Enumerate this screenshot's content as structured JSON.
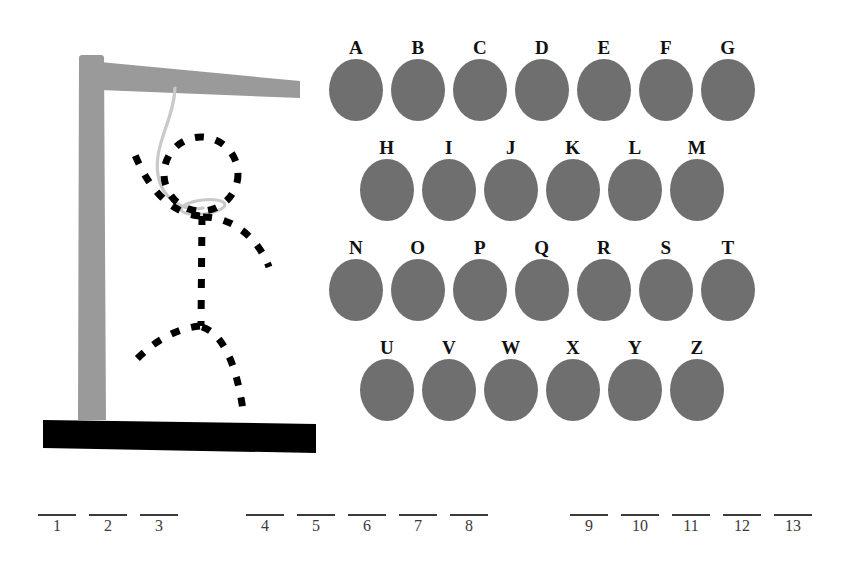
{
  "game": {
    "title": "Hangman",
    "colors": {
      "gallows": "#9a9a9a",
      "base": "#000000",
      "rope": "#c9c9c9",
      "figure": "#000000",
      "letter_blob": "#6f6f6f",
      "rule": "#3b3b3b",
      "background": "#ffffff"
    }
  },
  "gallows": {
    "post_label": "gallows-post",
    "beam_label": "gallows-beam",
    "base_label": "gallows-base",
    "rope_label": "hanging-rope",
    "noose_label": "noose-loop",
    "figure_parts": [
      "head",
      "torso",
      "left-arm",
      "right-arm",
      "left-leg",
      "right-leg"
    ],
    "figure_style": "dashed-outline"
  },
  "letter_board": {
    "rows": [
      {
        "indent": 0,
        "letters": [
          "A",
          "B",
          "C",
          "D",
          "E",
          "F",
          "G"
        ]
      },
      {
        "indent": 31,
        "letters": [
          "H",
          "I",
          "J",
          "K",
          "L",
          "M"
        ]
      },
      {
        "indent": 0,
        "letters": [
          "N",
          "O",
          "P",
          "Q",
          "R",
          "S",
          "T"
        ]
      },
      {
        "indent": 31,
        "letters": [
          "U",
          "V",
          "W",
          "X",
          "Y",
          "Z"
        ]
      }
    ]
  },
  "word_blanks": {
    "groups": [
      {
        "left": 38,
        "slots": [
          {
            "number": "1",
            "letter": ""
          },
          {
            "number": "2",
            "letter": ""
          },
          {
            "number": "3",
            "letter": ""
          }
        ]
      },
      {
        "left": 246,
        "slots": [
          {
            "number": "4",
            "letter": ""
          },
          {
            "number": "5",
            "letter": ""
          },
          {
            "number": "6",
            "letter": ""
          },
          {
            "number": "7",
            "letter": ""
          },
          {
            "number": "8",
            "letter": ""
          }
        ]
      },
      {
        "left": 570,
        "slots": [
          {
            "number": "9",
            "letter": ""
          },
          {
            "number": "10",
            "letter": ""
          },
          {
            "number": "11",
            "letter": ""
          },
          {
            "number": "12",
            "letter": ""
          },
          {
            "number": "13",
            "letter": ""
          }
        ]
      }
    ]
  }
}
